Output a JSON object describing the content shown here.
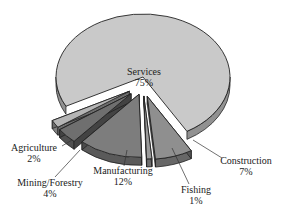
{
  "chart_data": {
    "type": "pie",
    "style": "3d-exploded",
    "title": "",
    "categories": [
      "Services",
      "Construction",
      "Fishing",
      "Manufacturing",
      "Mining/Forestry",
      "Agriculture"
    ],
    "values": [
      75,
      7,
      1,
      12,
      4,
      2
    ],
    "labels": [
      {
        "name": "Services",
        "pct": "75%"
      },
      {
        "name": "Construction",
        "pct": "7%"
      },
      {
        "name": "Fishing",
        "pct": "1%"
      },
      {
        "name": "Manufacturing",
        "pct": "12%"
      },
      {
        "name": "Mining/Forestry",
        "pct": "4%"
      },
      {
        "name": "Agriculture",
        "pct": "2%"
      }
    ],
    "colors": {
      "Services": "#c9c9c9",
      "Construction": "#8f8f8f",
      "Fishing": "#9a9a9a",
      "Manufacturing": "#7d7d7d",
      "Mining/Forestry": "#6f6f6f",
      "Agriculture": "#b5b5b5"
    },
    "legend": "none",
    "grid": false
  }
}
